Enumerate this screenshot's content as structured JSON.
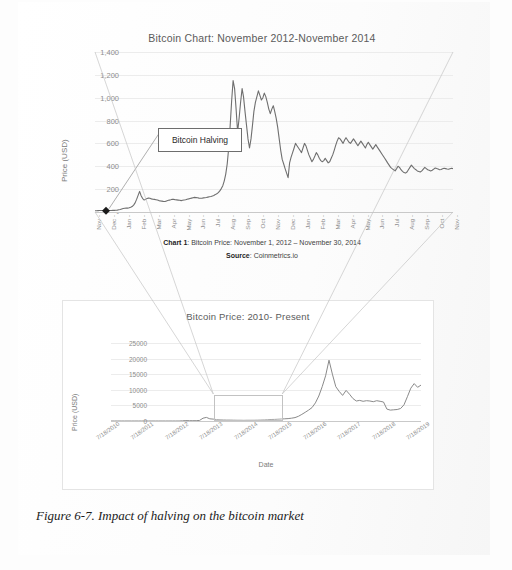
{
  "figure": {
    "caption": "Figure 6-7. Impact of halving on the bitcoin market"
  },
  "chart_top": {
    "title": "Bitcoin Chart: November 2012-November 2014",
    "ylabel": "Price (USD)",
    "annotation": "Bitcoin Halving",
    "caption_line1_bold": "Chart 1",
    "caption_line1": ": Bitcoin Price: November 1, 2012 – November 30, 2014",
    "caption_line2_bold": "Source",
    "caption_line2": ": Coinmetrics.io"
  },
  "chart_bottom": {
    "title": "Bitcoin Price: 2010- Present",
    "ylabel": "Price (USD)",
    "xlabel": "Date"
  },
  "chart_data": [
    {
      "id": "top",
      "type": "line",
      "title": "Bitcoin Chart: November 2012-November 2014",
      "xlabel": "",
      "ylabel": "Price (USD)",
      "ylim": [
        0,
        1400
      ],
      "yticks": [
        "-",
        "200",
        "400",
        "600",
        "800",
        "1,000",
        "1,200",
        "1,400"
      ],
      "ytick_values": [
        0,
        200,
        400,
        600,
        800,
        1000,
        1200,
        1400
      ],
      "grid": true,
      "legend": "none",
      "line_color": "#6f6f6f",
      "categories": [
        "Nov -",
        "Dec -",
        "Jan -",
        "Feb -",
        "Mar -",
        "Apr -",
        "May -",
        "Jun -",
        "Jul -",
        "Aug -",
        "Sep -",
        "Oct -",
        "Nov -",
        "Dec -",
        "Jan -",
        "Feb -",
        "Mar -",
        "Apr -",
        "May -",
        "Jun -",
        "Jul -",
        "Aug -",
        "Sep -",
        "Oct -",
        "Nov -"
      ],
      "annotations": [
        {
          "text": "Bitcoin Halving",
          "x_category": "Nov -",
          "y_value": 12
        }
      ],
      "values": [
        11,
        11,
        12,
        13,
        13,
        13,
        13,
        14,
        13,
        13,
        13,
        13,
        14,
        14,
        15,
        17,
        19,
        22,
        26,
        31,
        33,
        34,
        34,
        37,
        41,
        47,
        60,
        80,
        110,
        145,
        180,
        145,
        120,
        105,
        110,
        118,
        122,
        120,
        115,
        112,
        110,
        108,
        105,
        100,
        97,
        95,
        93,
        92,
        95,
        100,
        104,
        108,
        112,
        110,
        108,
        106,
        104,
        102,
        100,
        102,
        105,
        108,
        112,
        115,
        118,
        122,
        125,
        128,
        126,
        124,
        122,
        120,
        121,
        123,
        125,
        127,
        130,
        133,
        136,
        140,
        145,
        152,
        160,
        170,
        185,
        205,
        230,
        270,
        330,
        420,
        560,
        760,
        980,
        1150,
        1080,
        900,
        700,
        820,
        960,
        1080,
        1010,
        880,
        760,
        640,
        560,
        640,
        760,
        880,
        960,
        1010,
        1060,
        1020,
        980,
        1000,
        1040,
        1010,
        960,
        900,
        860,
        900,
        930,
        880,
        820,
        740,
        640,
        540,
        460,
        420,
        380,
        340,
        300,
        430,
        480,
        520,
        560,
        600,
        580,
        560,
        540,
        520,
        560,
        600,
        580,
        540,
        500,
        470,
        440,
        460,
        490,
        520,
        500,
        470,
        450,
        440,
        450,
        470,
        450,
        430,
        440,
        470,
        500,
        540,
        580,
        620,
        650,
        640,
        620,
        600,
        630,
        650,
        630,
        610,
        600,
        620,
        640,
        620,
        600,
        580,
        600,
        620,
        600,
        580,
        560,
        590,
        610,
        590,
        570,
        550,
        570,
        590,
        570,
        550,
        530,
        510,
        490,
        470,
        450,
        430,
        410,
        390,
        380,
        370,
        360,
        380,
        400,
        390,
        370,
        355,
        345,
        340,
        350,
        370,
        390,
        410,
        395,
        380,
        370,
        360,
        355,
        350,
        360,
        375,
        390,
        380,
        370,
        365,
        360,
        365,
        375,
        385,
        380,
        375,
        370,
        372,
        378,
        382,
        380,
        376,
        374,
        378,
        382,
        380
      ]
    },
    {
      "id": "bottom",
      "type": "line",
      "title": "Bitcoin Price: 2010- Present",
      "xlabel": "Date",
      "ylabel": "Price (USD)",
      "ylim": [
        0,
        25000
      ],
      "yticks": [
        "0",
        "5000",
        "10000",
        "15000",
        "20000",
        "25000"
      ],
      "ytick_values": [
        0,
        5000,
        10000,
        15000,
        20000,
        25000
      ],
      "grid": true,
      "legend": "none",
      "line_color": "#8a8a8a",
      "categories": [
        "7/18/2010",
        "7/18/2011",
        "7/18/2012",
        "7/18/2013",
        "7/18/2014",
        "7/18/2015",
        "7/18/2016",
        "7/18/2017",
        "7/18/2018",
        "7/18/2019"
      ],
      "highlight_region": {
        "from": "7/18/2013",
        "to": "7/18/2015"
      },
      "values": [
        5,
        6,
        8,
        10,
        12,
        14,
        15,
        14,
        13,
        12,
        11,
        10,
        10,
        11,
        12,
        13,
        13,
        12,
        12,
        13,
        14,
        60,
        130,
        100,
        90,
        110,
        180,
        900,
        1150,
        700,
        620,
        450,
        390,
        350,
        330,
        310,
        290,
        270,
        250,
        240,
        245,
        255,
        270,
        290,
        320,
        360,
        420,
        470,
        520,
        580,
        640,
        700,
        780,
        900,
        1100,
        1500,
        2100,
        2800,
        3500,
        4300,
        5800,
        8000,
        11000,
        14500,
        19500,
        15000,
        11000,
        9500,
        8200,
        9800,
        8600,
        7200,
        6400,
        6600,
        6300,
        6500,
        6400,
        6200,
        6500,
        6300,
        6100,
        3800,
        3500,
        3600,
        3700,
        4000,
        5200,
        7800,
        10500,
        12000,
        10800,
        11500
      ]
    }
  ]
}
